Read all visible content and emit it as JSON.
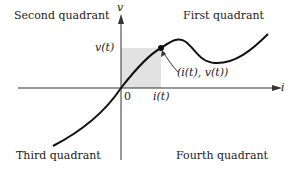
{
  "diagram": {
    "quadrants": {
      "second": "Second quadrant",
      "first": "First quadrant",
      "third": "Third quadrant",
      "fourth": "Fourth quadrant"
    },
    "axes": {
      "x_label": "i",
      "y_label": "v",
      "origin": "0"
    },
    "point_label": "(i(t), v(t))",
    "v_marker": "v(t)",
    "i_marker": "i(t)",
    "colors": {
      "curve": "#111111",
      "shade": "#e2e2e2",
      "axis": "#333333"
    }
  }
}
